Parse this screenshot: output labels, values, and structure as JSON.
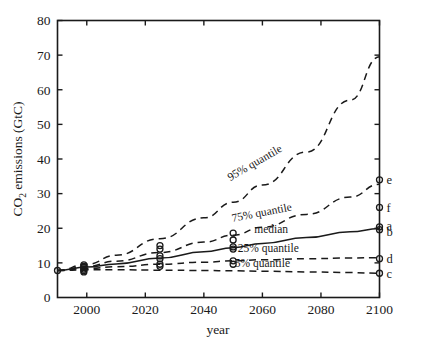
{
  "chart_data": {
    "type": "line",
    "title": "",
    "xlabel": "year",
    "ylabel": "CO2 emissions (GtC)",
    "ylabel_parts": {
      "pre": "CO",
      "sub": "2",
      "post": " emissions (GtC)"
    },
    "xlim": [
      1990,
      2100
    ],
    "ylim": [
      0,
      80
    ],
    "xticks": [
      2000,
      2020,
      2040,
      2060,
      2080,
      2100
    ],
    "xticklabels": [
      "2000",
      "2020",
      "2040",
      "2060",
      "2080",
      "2100"
    ],
    "yticks": [
      0,
      10,
      20,
      30,
      40,
      50,
      60,
      70,
      80
    ],
    "yticklabels": [
      "0",
      "10",
      "20",
      "30",
      "40",
      "50",
      "60",
      "70",
      "80"
    ],
    "grid": false,
    "legend_position": "inline-labels",
    "series": [
      {
        "name": "95% quantile",
        "label": "95% quantile",
        "style": "dashed",
        "x": [
          1990,
          2000,
          2010,
          2025,
          2040,
          2050,
          2060,
          2075,
          2090,
          2100
        ],
        "values": [
          7.8,
          9.6,
          12.2,
          17.0,
          23.0,
          27.5,
          32.5,
          42.0,
          57.0,
          69.5
        ]
      },
      {
        "name": "75% quantile",
        "label": "75% quantile",
        "style": "dashed",
        "x": [
          1990,
          2000,
          2010,
          2025,
          2040,
          2050,
          2060,
          2075,
          2090,
          2100
        ],
        "values": [
          7.8,
          9.0,
          10.5,
          13.0,
          16.0,
          18.0,
          20.3,
          24.0,
          29.0,
          32.7
        ]
      },
      {
        "name": "median",
        "label": "median",
        "style": "solid",
        "x": [
          1990,
          2000,
          2010,
          2025,
          2040,
          2050,
          2060,
          2075,
          2090,
          2100
        ],
        "values": [
          7.8,
          8.8,
          9.7,
          11.4,
          13.2,
          14.4,
          15.6,
          17.3,
          19.0,
          19.9
        ]
      },
      {
        "name": "25% quantile",
        "label": "25% quantile",
        "style": "dashed",
        "x": [
          1990,
          2000,
          2010,
          2025,
          2040,
          2050,
          2060,
          2075,
          2090,
          2100
        ],
        "values": [
          7.8,
          8.4,
          8.9,
          9.6,
          10.2,
          10.6,
          10.9,
          11.2,
          11.4,
          11.5
        ]
      },
      {
        "name": "5% quantile",
        "label": "5% quantile",
        "style": "dashed",
        "x": [
          1990,
          2000,
          2010,
          2025,
          2040,
          2050,
          2060,
          2075,
          2090,
          2100
        ],
        "values": [
          7.8,
          8.0,
          8.0,
          7.9,
          7.8,
          7.7,
          7.6,
          7.4,
          7.2,
          7.0
        ]
      }
    ],
    "scatter_points": [
      {
        "x": 1990,
        "y": 7.8
      },
      {
        "x": 1999,
        "y": 9.4
      },
      {
        "x": 1999,
        "y": 9.0
      },
      {
        "x": 1999,
        "y": 8.6
      },
      {
        "x": 1999,
        "y": 8.2
      },
      {
        "x": 1999,
        "y": 7.8
      },
      {
        "x": 1999,
        "y": 7.4
      },
      {
        "x": 2025,
        "y": 15.0
      },
      {
        "x": 2025,
        "y": 14.0
      },
      {
        "x": 2025,
        "y": 12.0
      },
      {
        "x": 2025,
        "y": 11.2
      },
      {
        "x": 2025,
        "y": 9.6
      },
      {
        "x": 2025,
        "y": 9.0
      },
      {
        "x": 2050,
        "y": 18.6
      },
      {
        "x": 2050,
        "y": 16.6
      },
      {
        "x": 2050,
        "y": 14.6
      },
      {
        "x": 2050,
        "y": 14.0
      },
      {
        "x": 2050,
        "y": 10.6
      },
      {
        "x": 2050,
        "y": 9.6
      },
      {
        "x": 2100,
        "y": 34.0
      },
      {
        "x": 2100,
        "y": 26.0
      },
      {
        "x": 2100,
        "y": 20.4
      },
      {
        "x": 2100,
        "y": 19.6
      },
      {
        "x": 2100,
        "y": 11.2
      },
      {
        "x": 2100,
        "y": 7.0
      }
    ],
    "endpoint_labels": [
      {
        "label": "e",
        "x": 2100,
        "y": 34.0
      },
      {
        "label": "f",
        "x": 2100,
        "y": 26.0
      },
      {
        "label": "a",
        "x": 2100,
        "y": 20.9
      },
      {
        "label": "b",
        "x": 2100,
        "y": 19.1
      },
      {
        "label": "d",
        "x": 2100,
        "y": 11.2
      },
      {
        "label": "c",
        "x": 2100,
        "y": 7.0
      }
    ],
    "curve_label_positions": [
      {
        "label": "95% quantile",
        "x": 2058,
        "y": 38.0,
        "rotate": -30
      },
      {
        "label": "75% quantile",
        "x": 2060,
        "y": 23.5,
        "rotate": -11
      },
      {
        "label": "median",
        "x": 2063,
        "y": 18.6,
        "rotate": 0
      },
      {
        "label": "25% quantile",
        "x": 2062,
        "y": 13.2,
        "rotate": 0
      },
      {
        "label": "5% quantile",
        "x": 2060,
        "y": 8.9,
        "rotate": 0
      }
    ],
    "colors": {
      "ink": "#1a1a1a",
      "background": "#ffffff"
    }
  }
}
